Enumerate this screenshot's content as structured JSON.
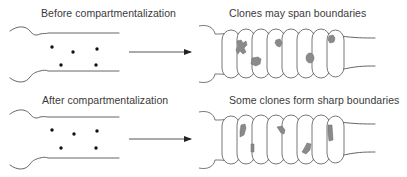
{
  "panels": [
    {
      "id": "before",
      "left_label": "Before compartmentalization",
      "right_label": "Clones may span boundaries",
      "dots": [
        [
          52,
          45
        ],
        [
          73,
          52
        ],
        [
          97,
          50
        ],
        [
          60,
          65
        ],
        [
          96,
          65
        ]
      ]
    },
    {
      "id": "after",
      "left_label": "After compartmentalization",
      "right_label": "Some clones form sharp boundaries",
      "dots": [
        [
          52,
          130
        ],
        [
          74,
          135
        ],
        [
          97,
          132
        ],
        [
          61,
          148
        ],
        [
          96,
          148
        ]
      ]
    }
  ],
  "icons": {
    "arrow": "right-arrow",
    "embryo_unsegmented": "unsegmented-embryo",
    "embryo_segmented": "segmented-embryo",
    "clone": "cell-clone-patch",
    "cell": "founder-cell-dot"
  },
  "colors": {
    "line": "#555555",
    "clone_fill": "#8a8a8a",
    "dot": "#111111",
    "text": "#3a3a3a"
  }
}
